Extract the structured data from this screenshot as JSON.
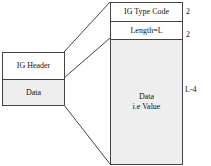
{
  "diagram": {
    "left_block": {
      "rows": [
        {
          "label": "IG Header"
        },
        {
          "label": "Data"
        }
      ]
    },
    "right_block": {
      "rows": [
        {
          "label": "IG Type Code",
          "size": "2"
        },
        {
          "label": "Length=L",
          "size": "2"
        },
        {
          "label_line1": "Data",
          "label_line2": "i.e Value",
          "size": "L-4"
        }
      ]
    }
  }
}
